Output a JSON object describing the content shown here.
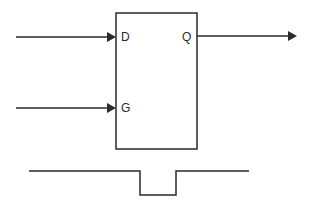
{
  "diagram": {
    "block": {
      "inputs": [
        {
          "id": "d",
          "label": "D"
        },
        {
          "id": "g",
          "label": "G"
        }
      ],
      "outputs": [
        {
          "id": "q",
          "label": "Q"
        }
      ]
    },
    "waveform": {
      "description": "gate pulse: high, low pulse, high",
      "levels": [
        "high",
        "low",
        "high"
      ]
    },
    "colors": {
      "line": "#2a2a2a",
      "background": "#ffffff"
    }
  }
}
